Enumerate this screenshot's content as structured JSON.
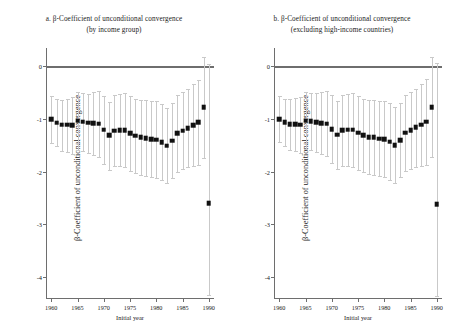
{
  "figure": {
    "y_axis_title": "β-Coefficient of unconditional convergence",
    "x_axis_title": "Initial year",
    "y_ticks": [
      "0",
      "-1",
      "-2",
      "-3",
      "-4"
    ],
    "y_tick_values": [
      0,
      -1,
      -2,
      -3,
      -4
    ],
    "x_ticks": [
      "1960",
      "1965",
      "1970",
      "1975",
      "1980",
      "1985",
      "1990"
    ],
    "x_tick_values": [
      1960,
      1965,
      1970,
      1975,
      1980,
      1985,
      1990
    ],
    "colors": {
      "marker": "#111111",
      "error_bar": "#c9c9c9",
      "axis": "#6e6e6e",
      "background": "#ffffff"
    }
  },
  "panels": [
    {
      "id": "panel-a",
      "title_line1": "a. β-Coefficient of unconditional convergence",
      "title_line2": "(by income group)"
    },
    {
      "id": "panel-b",
      "title_line1": "b. β-Coefficient of unconditional convergence",
      "title_line2": "(excluding high-income countries)"
    }
  ],
  "chart_data": [
    {
      "type": "scatter",
      "title": "a. β-Coefficient of unconditional convergence (by income group)",
      "xlabel": "Initial year",
      "ylabel": "β-Coefficient of unconditional convergence",
      "xlim": [
        1959,
        1991
      ],
      "ylim": [
        -4.4,
        0.35
      ],
      "grid": false,
      "legend": null,
      "error_bars": "95% confidence interval",
      "x": [
        1960,
        1961,
        1962,
        1963,
        1964,
        1965,
        1966,
        1967,
        1968,
        1969,
        1970,
        1971,
        1972,
        1973,
        1974,
        1975,
        1976,
        1977,
        1978,
        1979,
        1980,
        1981,
        1982,
        1983,
        1984,
        1985,
        1986,
        1987,
        1988,
        1989,
        1990
      ],
      "values": [
        -1.0,
        -1.07,
        -1.11,
        -1.11,
        -1.12,
        -1.03,
        -1.05,
        -1.07,
        -1.08,
        -1.09,
        -1.2,
        -1.31,
        -1.22,
        -1.21,
        -1.21,
        -1.27,
        -1.32,
        -1.35,
        -1.36,
        -1.38,
        -1.39,
        -1.44,
        -1.51,
        -1.41,
        -1.27,
        -1.22,
        -1.17,
        -1.12,
        -1.06,
        -0.78,
        -2.6
      ],
      "ci_low": [
        -1.45,
        -1.52,
        -1.6,
        -1.62,
        -1.66,
        -1.58,
        -1.6,
        -1.64,
        -1.68,
        -1.72,
        -1.85,
        -1.96,
        -1.9,
        -1.9,
        -1.92,
        -1.98,
        -2.02,
        -2.06,
        -2.08,
        -2.1,
        -2.12,
        -2.16,
        -2.22,
        -2.12,
        -2.0,
        -1.95,
        -1.92,
        -1.9,
        -1.88,
        -1.74,
        -4.35
      ],
      "ci_high": [
        -0.56,
        -0.62,
        -0.63,
        -0.61,
        -0.59,
        -0.49,
        -0.51,
        -0.52,
        -0.49,
        -0.47,
        -0.56,
        -0.67,
        -0.55,
        -0.53,
        -0.51,
        -0.57,
        -0.62,
        -0.64,
        -0.64,
        -0.66,
        -0.66,
        -0.71,
        -0.79,
        -0.7,
        -0.55,
        -0.49,
        -0.43,
        -0.34,
        -0.25,
        0.17,
        0.05
      ]
    },
    {
      "type": "scatter",
      "title": "b. β-Coefficient of unconditional convergence (excluding high-income countries)",
      "xlabel": "Initial year",
      "ylabel": "β-Coefficient of unconditional convergence",
      "xlim": [
        1959,
        1991
      ],
      "ylim": [
        -4.4,
        0.35
      ],
      "grid": false,
      "legend": null,
      "error_bars": "95% confidence interval",
      "x": [
        1960,
        1961,
        1962,
        1963,
        1964,
        1965,
        1966,
        1967,
        1968,
        1969,
        1970,
        1971,
        1972,
        1973,
        1974,
        1975,
        1976,
        1977,
        1978,
        1979,
        1980,
        1981,
        1982,
        1983,
        1984,
        1985,
        1986,
        1987,
        1988,
        1989,
        1990
      ],
      "values": [
        -1.0,
        -1.06,
        -1.1,
        -1.1,
        -1.11,
        -1.03,
        -1.04,
        -1.06,
        -1.08,
        -1.09,
        -1.19,
        -1.3,
        -1.21,
        -1.2,
        -1.2,
        -1.26,
        -1.31,
        -1.34,
        -1.35,
        -1.37,
        -1.38,
        -1.43,
        -1.5,
        -1.4,
        -1.26,
        -1.21,
        -1.16,
        -1.11,
        -1.05,
        -0.77,
        -2.62
      ],
      "ci_low": [
        -1.44,
        -1.51,
        -1.59,
        -1.61,
        -1.65,
        -1.57,
        -1.59,
        -1.63,
        -1.67,
        -1.71,
        -1.84,
        -1.95,
        -1.89,
        -1.89,
        -1.91,
        -1.97,
        -2.01,
        -2.05,
        -2.07,
        -2.09,
        -2.11,
        -2.15,
        -2.21,
        -2.11,
        -1.99,
        -1.94,
        -1.91,
        -1.89,
        -1.87,
        -1.73,
        -4.36
      ],
      "ci_high": [
        -0.56,
        -0.61,
        -0.62,
        -0.6,
        -0.58,
        -0.49,
        -0.5,
        -0.51,
        -0.48,
        -0.46,
        -0.55,
        -0.66,
        -0.54,
        -0.52,
        -0.5,
        -0.56,
        -0.61,
        -0.63,
        -0.63,
        -0.65,
        -0.65,
        -0.7,
        -0.78,
        -0.69,
        -0.54,
        -0.48,
        -0.42,
        -0.33,
        -0.24,
        0.18,
        0.06
      ]
    }
  ]
}
